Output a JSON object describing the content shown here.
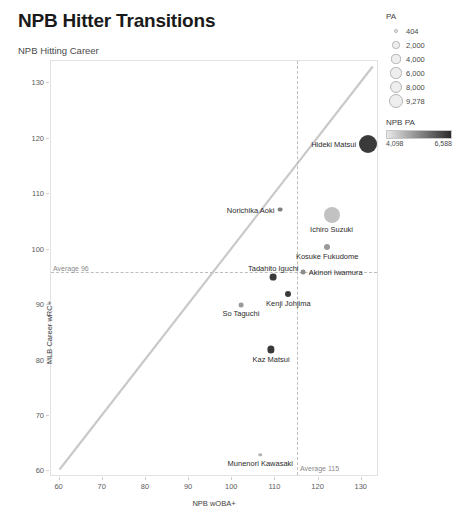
{
  "header": {
    "title": "NPB Hitter Transitions",
    "subtitle": "NPB Hitting Career"
  },
  "chart_data": {
    "type": "scatter",
    "title": "NPB Hitter Transitions",
    "subtitle": "NPB Hitting Career",
    "xlabel": "NPB wOBA+",
    "ylabel": "MLB Career wRC+",
    "xlim": [
      58,
      134
    ],
    "ylim": [
      59,
      134
    ],
    "xticks": [
      60,
      70,
      80,
      90,
      100,
      110,
      120,
      130
    ],
    "yticks": [
      60,
      70,
      80,
      90,
      100,
      110,
      120,
      130
    ],
    "grid": false,
    "reference_line": {
      "type": "diagonal",
      "label": "y = x",
      "from": [
        60,
        60
      ],
      "to": [
        133,
        133
      ],
      "color": "#c9c9c9"
    },
    "annotations": [
      {
        "name": "average-x-line",
        "text": "Average 115",
        "orientation": "vertical",
        "value": 115
      },
      {
        "name": "average-y-line",
        "text": "Average 96",
        "orientation": "horizontal",
        "value": 96
      }
    ],
    "points": [
      {
        "label": "Hideki Matsui",
        "x": 131.5,
        "y": 119.0,
        "pa": 9278,
        "npb_pa": 6588,
        "size": 9.0,
        "fill": "#3a3a3a",
        "label_side": "left"
      },
      {
        "label": "Norichika Aoki",
        "x": 111.0,
        "y": 107.2,
        "pa": 404,
        "npb_pa": 4098,
        "size": 2.4,
        "fill": "#808080",
        "label_side": "left"
      },
      {
        "label": "Ichiro Suzuki",
        "x": 123.0,
        "y": 106.3,
        "pa": 6000,
        "npb_pa": 5200,
        "size": 8.0,
        "fill": "#c2c2c2",
        "label_side": "below"
      },
      {
        "label": "Kosuke Fukudome",
        "x": 122.0,
        "y": 100.5,
        "pa": 2000,
        "npb_pa": 4600,
        "size": 3.0,
        "fill": "#9a9a9a",
        "label_side": "below"
      },
      {
        "label": "Tadahito Iguchi",
        "x": 109.5,
        "y": 95.0,
        "pa": 2000,
        "npb_pa": 5100,
        "size": 3.4,
        "fill": "#3a3a3a",
        "label_side": "above"
      },
      {
        "label": "Akinori Iwamura",
        "x": 116.5,
        "y": 96.0,
        "pa": 2000,
        "npb_pa": 4300,
        "size": 2.4,
        "fill": "#8c8c8c",
        "label_side": "right"
      },
      {
        "label": "Kenji Johjima",
        "x": 113.0,
        "y": 92.0,
        "pa": 2000,
        "npb_pa": 5400,
        "size": 3.0,
        "fill": "#3a3a3a",
        "label_side": "below"
      },
      {
        "label": "So Taguchi",
        "x": 102.0,
        "y": 90.0,
        "pa": 2000,
        "npb_pa": 4500,
        "size": 2.4,
        "fill": "#9a9a9a",
        "label_side": "below"
      },
      {
        "label": "Kaz Matsui",
        "x": 109.0,
        "y": 82.0,
        "pa": 4000,
        "npb_pa": 5000,
        "size": 3.6,
        "fill": "#3a3a3a",
        "label_side": "below"
      },
      {
        "label": "Munenori Kawasaki",
        "x": 106.5,
        "y": 63.0,
        "pa": 404,
        "npb_pa": 4098,
        "size": 1.8,
        "fill": "#b5b5b5",
        "label_side": "below"
      }
    ]
  },
  "legends": {
    "size_legend": {
      "title": "PA",
      "items": [
        {
          "value": "404",
          "radius": 1.3
        },
        {
          "value": "2,000",
          "radius": 2.6
        },
        {
          "value": "4,000",
          "radius": 3.6
        },
        {
          "value": "6,000",
          "radius": 4.6
        },
        {
          "value": "8,000",
          "radius": 5.4
        },
        {
          "value": "9,278",
          "radius": 6.2
        }
      ]
    },
    "color_legend": {
      "title": "NPB PA",
      "min_label": "4,098",
      "max_label": "6,588",
      "gradient_from": "#e8e8e8",
      "gradient_to": "#2b2b2b"
    }
  }
}
